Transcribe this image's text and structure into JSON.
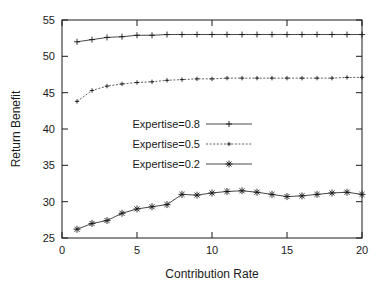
{
  "chart_data": {
    "type": "line",
    "title": "",
    "xlabel": "Contribution Rate",
    "ylabel": "Return Benefit",
    "xlim": [
      0,
      20
    ],
    "ylim": [
      25,
      55
    ],
    "xticks": [
      0,
      5,
      10,
      15,
      20
    ],
    "yticks": [
      25,
      30,
      35,
      40,
      45,
      50,
      55
    ],
    "grid": false,
    "legend_position": "center",
    "x": [
      1,
      2,
      3,
      4,
      5,
      6,
      7,
      8,
      9,
      10,
      11,
      12,
      13,
      14,
      15,
      16,
      17,
      18,
      19,
      20
    ],
    "series": [
      {
        "name": "Expertise=0.8",
        "marker": "plus",
        "values": [
          52.0,
          52.3,
          52.6,
          52.7,
          52.9,
          52.9,
          53.0,
          53.0,
          53.0,
          53.0,
          53.0,
          53.0,
          53.0,
          53.0,
          53.0,
          53.0,
          53.0,
          53.0,
          53.0,
          53.0
        ]
      },
      {
        "name": "Expertise=0.5",
        "marker": "cross-small",
        "values": [
          43.8,
          45.3,
          45.9,
          46.2,
          46.4,
          46.5,
          46.7,
          46.8,
          46.9,
          46.9,
          47.0,
          47.0,
          47.0,
          47.0,
          47.0,
          47.0,
          47.0,
          47.0,
          47.1,
          47.1
        ]
      },
      {
        "name": "Expertise=0.2",
        "marker": "star",
        "values": [
          26.2,
          27.0,
          27.4,
          28.4,
          29.0,
          29.3,
          29.6,
          31.0,
          30.9,
          31.2,
          31.4,
          31.5,
          31.3,
          31.0,
          30.7,
          30.8,
          31.0,
          31.2,
          31.3,
          31.0
        ]
      }
    ]
  },
  "legend": {
    "items": [
      {
        "label": "Expertise=0.8"
      },
      {
        "label": "Expertise=0.5"
      },
      {
        "label": "Expertise=0.2"
      }
    ]
  },
  "ticklabels": {
    "x": [
      "0",
      "5",
      "10",
      "15",
      "20"
    ],
    "y": [
      "25",
      "30",
      "35",
      "40",
      "45",
      "50",
      "55"
    ]
  },
  "labels": {
    "x_axis": "Contribution Rate",
    "y_axis": "Return Benefit"
  }
}
